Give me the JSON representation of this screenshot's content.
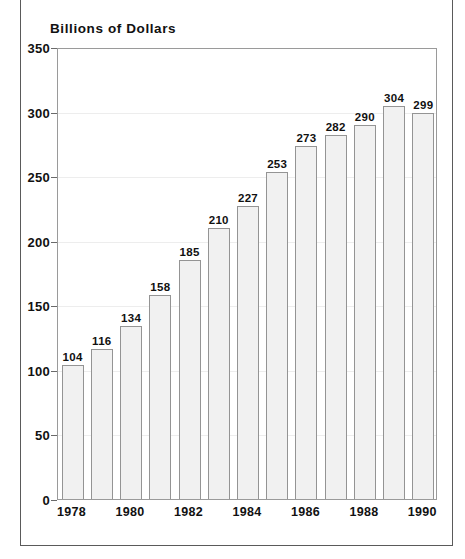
{
  "chart_data": {
    "type": "bar",
    "title": "Billions of Dollars",
    "xlabel": "",
    "ylabel": "",
    "ylim": [
      0,
      350
    ],
    "yticks": [
      0,
      50,
      100,
      150,
      200,
      250,
      300,
      350
    ],
    "ytick_labels": [
      "0",
      "50",
      "100",
      "150",
      "200",
      "250",
      "300",
      "350"
    ],
    "grid": true,
    "legend": false,
    "categories": [
      "1978",
      "1979",
      "1980",
      "1981",
      "1982",
      "1983",
      "1984",
      "1985",
      "1986",
      "1987",
      "1988",
      "1989",
      "1990"
    ],
    "xtick_labels_shown": [
      "1978",
      "1980",
      "1982",
      "1984",
      "1986",
      "1988",
      "1990"
    ],
    "values": [
      104,
      116,
      134,
      158,
      185,
      210,
      227,
      253,
      273,
      282,
      290,
      304,
      299
    ],
    "data_labels": [
      "104",
      "116",
      "134",
      "158",
      "185",
      "210",
      "227",
      "253",
      "273",
      "282",
      "290",
      "304",
      "299"
    ],
    "bar_fill_color": "#f1f1f1",
    "bar_edge_color": "#949494",
    "gridline_color": "#ededed",
    "axis_color": "#9a9a9a",
    "text_color": "#111111",
    "background_color": "#ffffff"
  },
  "frame": {
    "border_color": "#5a5a5a"
  }
}
